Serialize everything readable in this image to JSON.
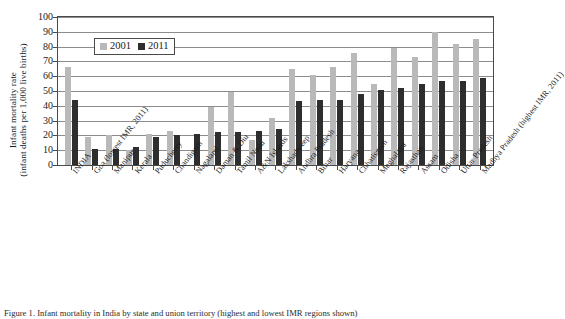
{
  "figure": {
    "ylabel_line1": "Infant mortality rate",
    "ylabel_line2": "(infant deaths per 1,000 live births)",
    "caption": "Figure 1. Infant mortality in India by state and union territory (highest and lowest IMR regions shown)"
  },
  "legend": {
    "position": "inside-top-left",
    "items": [
      {
        "label": "2001",
        "color": "#b9b9b9"
      },
      {
        "label": "2011",
        "color": "#2e2e2e"
      }
    ]
  },
  "chart_data": {
    "type": "bar",
    "title": "",
    "xlabel": "",
    "ylabel": "Infant mortality rate (infant deaths per 1,000 live births)",
    "ylim": [
      0,
      100
    ],
    "yticks": [
      0,
      10,
      20,
      30,
      40,
      50,
      60,
      70,
      80,
      90,
      100
    ],
    "grid": true,
    "legend_position": "upper left inside plot",
    "categories": [
      "INDIA",
      "Goa (lowest IMR, 2011)",
      "Manipur",
      "Kerala",
      "Puducherry",
      "Chandigarh",
      "Nagaland",
      "Daman & Diu",
      "Tamil Nadu",
      "A&N Islands",
      "Lakshadweep",
      "Andhra Pradesh",
      "Bihar",
      "Haryana",
      "Chhatisgarh",
      "Meghalaya",
      "Rajasthan",
      "Assam",
      "Odisha",
      "Uttar Pradesh",
      "Madhya Pradesh (highest IMR, 2011)"
    ],
    "series": [
      {
        "name": "2001",
        "color": "#b9b9b9",
        "values": [
          66,
          19,
          20,
          10,
          21,
          23,
          null,
          39,
          49,
          17,
          32,
          65,
          61,
          66,
          76,
          55,
          79,
          73,
          90,
          82,
          85
        ]
      },
      {
        "name": "2011",
        "color": "#2e2e2e",
        "values": [
          44,
          11,
          11,
          12,
          19,
          20,
          21,
          22,
          22,
          23,
          24,
          43,
          44,
          44,
          48,
          51,
          52,
          55,
          57,
          57,
          59
        ]
      }
    ]
  }
}
